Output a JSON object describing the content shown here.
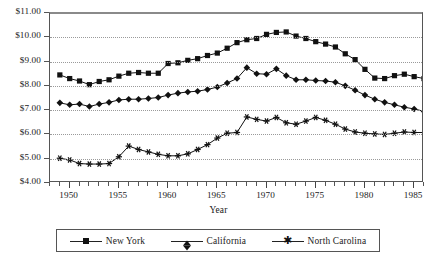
{
  "chart_data": {
    "type": "line",
    "title": "",
    "xlabel": "Year",
    "ylabel": "",
    "xlim": [
      1948,
      1986
    ],
    "ylim": [
      4.0,
      11.0
    ],
    "ytick_step": 1.0,
    "ytick_labels": [
      "$4.00",
      "$5.00",
      "$6.00",
      "$7.00",
      "$8.00",
      "$9.00",
      "$10.00",
      "$11.00"
    ],
    "ytick_values": [
      4,
      5,
      6,
      7,
      8,
      9,
      10,
      11
    ],
    "xtick_labels": [
      "1950",
      "1955",
      "1960",
      "1965",
      "1970",
      "1975",
      "1980",
      "1985"
    ],
    "xtick_values": [
      1950,
      1955,
      1960,
      1965,
      1970,
      1975,
      1980,
      1985
    ],
    "xtick_minor_step": 1,
    "grid": true,
    "grid_axis": "y",
    "legend_position": "bottom",
    "x": [
      1949,
      1950,
      1951,
      1952,
      1953,
      1954,
      1955,
      1956,
      1957,
      1958,
      1959,
      1960,
      1961,
      1962,
      1963,
      1964,
      1965,
      1966,
      1967,
      1968,
      1969,
      1970,
      1971,
      1972,
      1973,
      1974,
      1975,
      1976,
      1977,
      1978,
      1979,
      1980,
      1981,
      1982,
      1983,
      1984,
      1985,
      1986
    ],
    "series": [
      {
        "name": "New York",
        "marker": "square",
        "values": [
          8.45,
          8.3,
          8.2,
          8.05,
          8.18,
          8.25,
          8.4,
          8.52,
          8.55,
          8.52,
          8.52,
          8.92,
          8.95,
          9.05,
          9.12,
          9.25,
          9.35,
          9.55,
          9.78,
          9.9,
          9.95,
          10.12,
          10.2,
          10.22,
          10.05,
          9.95,
          9.82,
          9.72,
          9.6,
          9.32,
          9.08,
          8.68,
          8.32,
          8.3,
          8.42,
          8.48,
          8.38,
          8.3
        ]
      },
      {
        "name": "California",
        "marker": "diamond",
        "values": [
          7.3,
          7.22,
          7.25,
          7.15,
          7.25,
          7.32,
          7.42,
          7.45,
          7.45,
          7.48,
          7.52,
          7.62,
          7.7,
          7.75,
          7.78,
          7.85,
          7.95,
          8.12,
          8.3,
          8.75,
          8.5,
          8.48,
          8.7,
          8.42,
          8.25,
          8.25,
          8.22,
          8.2,
          8.15,
          8.0,
          7.82,
          7.62,
          7.45,
          7.32,
          7.22,
          7.12,
          7.05,
          6.95
        ]
      },
      {
        "name": "North Carolina",
        "marker": "star",
        "values": [
          5.02,
          4.95,
          4.8,
          4.78,
          4.78,
          4.8,
          5.08,
          5.52,
          5.38,
          5.28,
          5.18,
          5.12,
          5.12,
          5.2,
          5.38,
          5.58,
          5.85,
          6.05,
          6.08,
          6.72,
          6.62,
          6.55,
          6.7,
          6.48,
          6.42,
          6.55,
          6.7,
          6.58,
          6.42,
          6.22,
          6.1,
          6.05,
          6.02,
          6.0,
          6.05,
          6.1,
          6.08,
          6.08
        ]
      }
    ]
  },
  "legend": {
    "items": [
      {
        "label": "New York",
        "marker": "square"
      },
      {
        "label": "California",
        "marker": "diamond"
      },
      {
        "label": "North Carolina",
        "marker": "star"
      }
    ]
  },
  "colors": {
    "line": "#111111",
    "axis": "#555555",
    "grid": "#9a9a9a",
    "background": "#ffffff"
  }
}
